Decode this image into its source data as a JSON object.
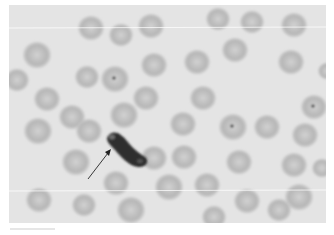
{
  "figure": {
    "background_color": "#e4e4e4",
    "cell_color": "#b8b8b8",
    "annotation": {
      "type": "arrow",
      "target": "crescent-shaped body",
      "color": "#222222"
    },
    "cells": [
      {
        "x": 28,
        "y": 50,
        "r": 14
      },
      {
        "x": 82,
        "y": 23,
        "r": 13
      },
      {
        "x": 112,
        "y": 30,
        "r": 12
      },
      {
        "x": 142,
        "y": 21,
        "r": 13
      },
      {
        "x": 209,
        "y": 14,
        "r": 12
      },
      {
        "x": 243,
        "y": 17,
        "r": 12
      },
      {
        "x": 285,
        "y": 20,
        "r": 13
      },
      {
        "x": 8,
        "y": 75,
        "r": 12
      },
      {
        "x": 38,
        "y": 94,
        "r": 13
      },
      {
        "x": 78,
        "y": 72,
        "r": 12
      },
      {
        "x": 145,
        "y": 60,
        "r": 13
      },
      {
        "x": 188,
        "y": 57,
        "r": 13
      },
      {
        "x": 226,
        "y": 45,
        "r": 13
      },
      {
        "x": 282,
        "y": 57,
        "r": 13
      },
      {
        "x": 318,
        "y": 66,
        "r": 9
      },
      {
        "x": 106,
        "y": 74,
        "r": 14,
        "dot": true
      },
      {
        "x": 137,
        "y": 93,
        "r": 13
      },
      {
        "x": 194,
        "y": 93,
        "r": 13
      },
      {
        "x": 63,
        "y": 112,
        "r": 13
      },
      {
        "x": 80,
        "y": 126,
        "r": 13
      },
      {
        "x": 115,
        "y": 110,
        "r": 14
      },
      {
        "x": 174,
        "y": 119,
        "r": 13
      },
      {
        "x": 224,
        "y": 122,
        "r": 14,
        "dot": true
      },
      {
        "x": 258,
        "y": 122,
        "r": 13
      },
      {
        "x": 296,
        "y": 130,
        "r": 13
      },
      {
        "x": 305,
        "y": 102,
        "r": 13,
        "dot": true
      },
      {
        "x": 29,
        "y": 126,
        "r": 14
      },
      {
        "x": 67,
        "y": 157,
        "r": 14
      },
      {
        "x": 145,
        "y": 153,
        "r": 13
      },
      {
        "x": 175,
        "y": 152,
        "r": 13
      },
      {
        "x": 230,
        "y": 157,
        "r": 13
      },
      {
        "x": 285,
        "y": 160,
        "r": 13
      },
      {
        "x": 313,
        "y": 163,
        "r": 10
      },
      {
        "x": 107,
        "y": 178,
        "r": 13
      },
      {
        "x": 160,
        "y": 182,
        "r": 14
      },
      {
        "x": 198,
        "y": 180,
        "r": 13
      },
      {
        "x": 238,
        "y": 196,
        "r": 13
      },
      {
        "x": 290,
        "y": 192,
        "r": 14
      },
      {
        "x": 30,
        "y": 195,
        "r": 13
      },
      {
        "x": 75,
        "y": 200,
        "r": 12
      },
      {
        "x": 122,
        "y": 205,
        "r": 14
      },
      {
        "x": 205,
        "y": 212,
        "r": 12
      },
      {
        "x": 270,
        "y": 205,
        "r": 12
      }
    ],
    "crescent": {
      "x1": 104,
      "y1": 134,
      "x2": 133,
      "y2": 157
    }
  }
}
